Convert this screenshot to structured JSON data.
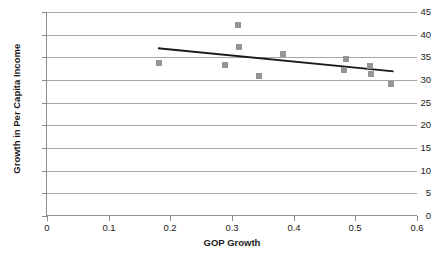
{
  "chart_data": {
    "type": "scatter",
    "title": "",
    "xlabel": "GOP Growth",
    "ylabel": "Growth in Per Capita Income",
    "xlim": [
      0,
      0.6
    ],
    "ylim": [
      0,
      45
    ],
    "x_ticks": [
      "0",
      "0.1",
      "0.2",
      "0.3",
      "0.4",
      "0.5",
      "0.6"
    ],
    "x_tick_values": [
      0,
      0.1,
      0.2,
      0.3,
      0.4,
      0.5,
      0.6
    ],
    "y_ticks": [
      "0",
      "5",
      "10",
      "15",
      "20",
      "25",
      "30",
      "35",
      "40",
      "45"
    ],
    "y_tick_values": [
      0,
      5,
      10,
      15,
      20,
      25,
      30,
      35,
      40,
      45
    ],
    "grid": "horizontal",
    "legend": "none",
    "marker_color": "#959595",
    "marker_shape": "square",
    "gridline_color": "#a6a6a6",
    "axis_color": "#8c8c8c",
    "points": [
      {
        "x": 0.181,
        "y": 33.8
      },
      {
        "x": 0.289,
        "y": 33.4
      },
      {
        "x": 0.31,
        "y": 42.2
      },
      {
        "x": 0.312,
        "y": 37.3
      },
      {
        "x": 0.344,
        "y": 31.0
      },
      {
        "x": 0.383,
        "y": 35.7
      },
      {
        "x": 0.481,
        "y": 32.3
      },
      {
        "x": 0.485,
        "y": 34.7
      },
      {
        "x": 0.524,
        "y": 33.2
      },
      {
        "x": 0.525,
        "y": 31.3
      },
      {
        "x": 0.558,
        "y": 29.2
      }
    ],
    "trendline": {
      "color": "#1a1a1a",
      "x_start": 0.18,
      "y_start": 37.0,
      "x_end": 0.562,
      "y_end": 31.9
    }
  }
}
